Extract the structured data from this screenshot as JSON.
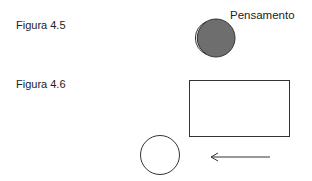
{
  "figures": [
    {
      "label": "Figura 4.5",
      "caption": "Pensamento"
    },
    {
      "label": "Figura 4.6"
    }
  ],
  "colors": {
    "shade": "#6e6e6e",
    "stroke": "#333333"
  }
}
